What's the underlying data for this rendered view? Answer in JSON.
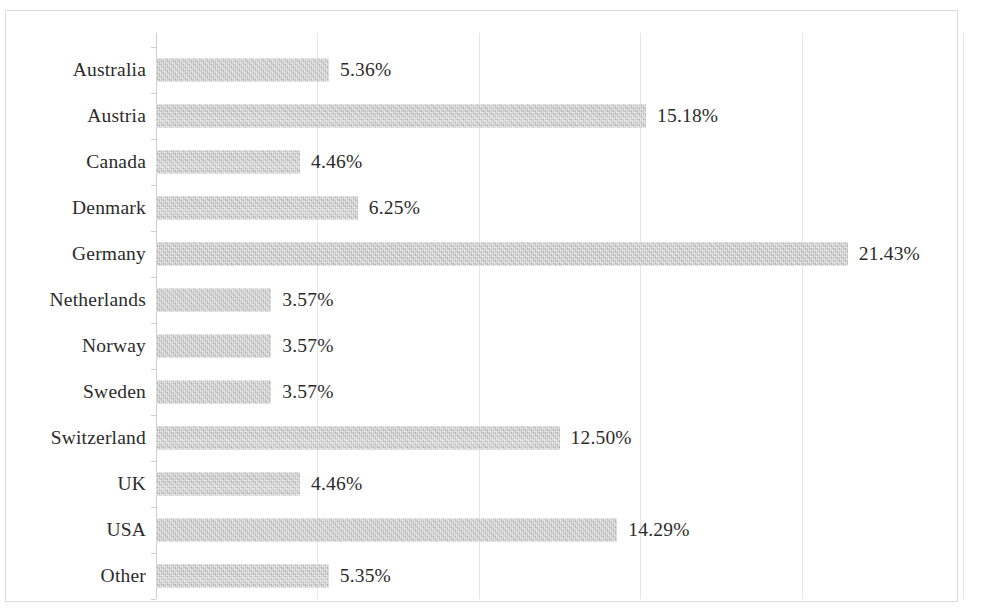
{
  "chart_data": {
    "type": "bar",
    "orientation": "horizontal",
    "title": "",
    "subtitle": "",
    "xlabel": "",
    "ylabel": "",
    "xlim": [
      0,
      25
    ],
    "ylim": null,
    "grid": true,
    "grid_axis": "x",
    "gridline_values": [
      0,
      5,
      10,
      15,
      20,
      25
    ],
    "legend": false,
    "legend_position": "none",
    "tick_labels_visible": false,
    "value_label_format": "0.00%",
    "bar_color": "#bcbcbc",
    "gridline_color": "#e6e6e6",
    "axis_color": "#cfcfcf",
    "text_color": "#2b2b2b",
    "categories": [
      "Australia",
      "Austria",
      "Canada",
      "Denmark",
      "Germany",
      "Netherlands",
      "Norway",
      "Sweden",
      "Switzerland",
      "UK",
      "USA",
      "Other"
    ],
    "values": [
      5.36,
      15.18,
      4.46,
      6.25,
      21.43,
      3.57,
      3.57,
      3.57,
      12.5,
      4.46,
      14.29,
      5.35
    ],
    "value_labels": [
      "5.36%",
      "15.18%",
      "4.46%",
      "6.25%",
      "21.43%",
      "3.57%",
      "3.57%",
      "3.57%",
      "12.50%",
      "4.46%",
      "14.29%",
      "5.35%"
    ]
  }
}
